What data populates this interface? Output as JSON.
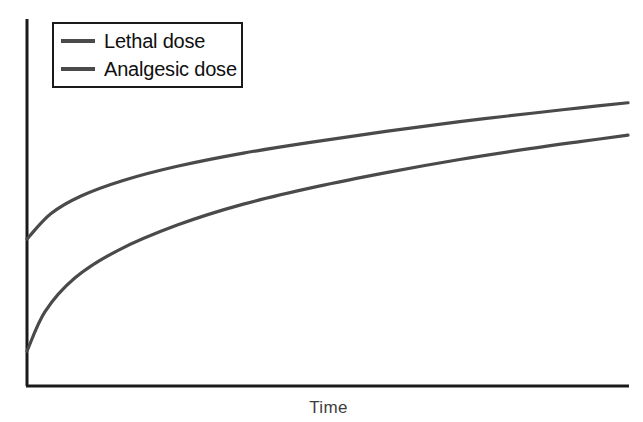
{
  "chart_data": {
    "type": "line",
    "title": "",
    "xlabel": "Time",
    "ylabel": "",
    "grid": false,
    "legend_position": "top-left",
    "xlim": [
      0,
      100
    ],
    "ylim": [
      0,
      100
    ],
    "axis_ticks": {
      "x": [],
      "y": []
    },
    "series": [
      {
        "name": "Lethal dose",
        "color": "#4a4a4a",
        "points": [
          {
            "x": 0,
            "y": 43.5
          },
          {
            "x": 4,
            "y": 51.0
          },
          {
            "x": 9,
            "y": 56.2
          },
          {
            "x": 16,
            "y": 60.8
          },
          {
            "x": 25,
            "y": 65.0
          },
          {
            "x": 36,
            "y": 68.9
          },
          {
            "x": 48,
            "y": 72.3
          },
          {
            "x": 60,
            "y": 75.4
          },
          {
            "x": 72,
            "y": 78.2
          },
          {
            "x": 84,
            "y": 80.7
          },
          {
            "x": 92,
            "y": 82.3
          },
          {
            "x": 100,
            "y": 83.8
          }
        ]
      },
      {
        "name": "Analgesic dose",
        "color": "#4a4a4a",
        "points": [
          {
            "x": 0,
            "y": 10.3
          },
          {
            "x": 3,
            "y": 22.0
          },
          {
            "x": 8,
            "y": 32.0
          },
          {
            "x": 15,
            "y": 40.0
          },
          {
            "x": 25,
            "y": 47.6
          },
          {
            "x": 36,
            "y": 53.8
          },
          {
            "x": 48,
            "y": 58.9
          },
          {
            "x": 60,
            "y": 63.2
          },
          {
            "x": 72,
            "y": 67.0
          },
          {
            "x": 84,
            "y": 70.3
          },
          {
            "x": 92,
            "y": 72.3
          },
          {
            "x": 100,
            "y": 74.2
          }
        ]
      }
    ],
    "legend": [
      {
        "label": "Lethal dose",
        "swatch_color": "#4a4a4a"
      },
      {
        "label": "Analgesic dose",
        "swatch_color": "#4a4a4a"
      }
    ]
  },
  "axes": {
    "x_axis_label": "Time",
    "axis_color": "#1a1a1a"
  },
  "legend": {
    "entries": [
      {
        "label": "Lethal dose"
      },
      {
        "label": "Analgesic dose"
      }
    ]
  }
}
